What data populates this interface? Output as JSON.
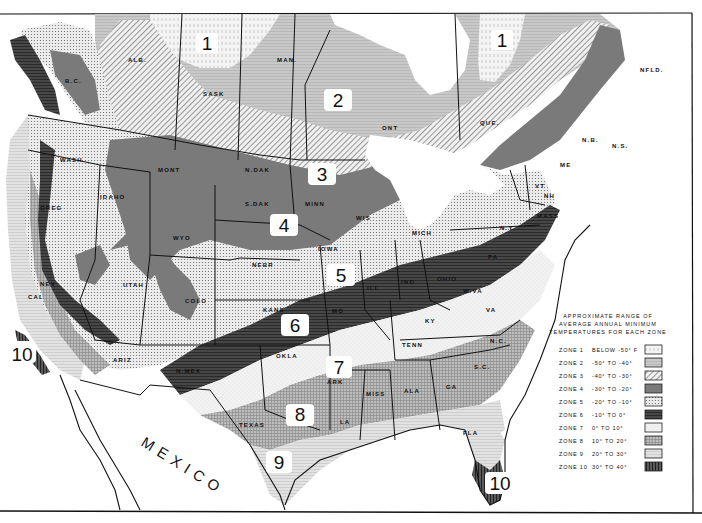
{
  "map": {
    "title": "Plant Hardiness Zone Map of North America",
    "legend": {
      "title_lines": [
        "APPROXIMATE RANGE OF",
        "AVERAGE ANNUAL MINIMUM",
        "TEMPERATURES FOR EACH ZONE"
      ],
      "zones": [
        {
          "zone": "ZONE 1",
          "range": "BELOW -50° F",
          "pattern": "vertical-dash-light"
        },
        {
          "zone": "ZONE 2",
          "range": "-50° TO -40°",
          "pattern": "horizontal-lines-light"
        },
        {
          "zone": "ZONE 3",
          "range": "-40° TO -30°",
          "pattern": "diagonal-hatch"
        },
        {
          "zone": "ZONE 4",
          "range": "-30° TO -20°",
          "pattern": "solid-gray"
        },
        {
          "zone": "ZONE 5",
          "range": "-20° TO -10°",
          "pattern": "dots"
        },
        {
          "zone": "ZONE 6",
          "range": "-10° TO 0°",
          "pattern": "horizontal-lines-dark"
        },
        {
          "zone": "ZONE 7",
          "range": "0° TO 10°",
          "pattern": "light-stipple"
        },
        {
          "zone": "ZONE 8",
          "range": "10° TO 20°",
          "pattern": "crosshatch"
        },
        {
          "zone": "ZONE 9",
          "range": "20° TO 30°",
          "pattern": "horizontal-lines-fine"
        },
        {
          "zone": "ZONE 10",
          "range": "30° TO 40°",
          "pattern": "vertical-lines-dark"
        }
      ]
    },
    "zone_badges": [
      "1",
      "1",
      "2",
      "3",
      "4",
      "5",
      "6",
      "7",
      "8",
      "9",
      "10",
      "10"
    ],
    "region_labels": {
      "alb": "ALB.",
      "sask": "SASK",
      "man": "MAN.",
      "ont": "ONT",
      "que": "QUE.",
      "nfld": "NFLD.",
      "bc": "B.C.",
      "wash": "WASH",
      "oreg": "OREG",
      "idaho": "IDAHO",
      "mont": "MONT",
      "ndak": "N.DAK",
      "sdak": "S.DAK",
      "minn": "MINN",
      "wis": "WIS",
      "mich": "MICH",
      "wyo": "WYO",
      "nev": "NEV",
      "utah": "UTAH",
      "colo": "COLO",
      "nebr": "NEBR",
      "iowa": "IOWA",
      "kans": "KANS",
      "mo": "MO",
      "ill": "ILL",
      "ind": "IND",
      "ohio": "OHIO",
      "ny": "N.Y.",
      "pa": "PA",
      "vt": "VT",
      "nh": "NH",
      "me": "ME",
      "mass": "MASS",
      "nb": "N.B.",
      "ns": "N.S.",
      "ky": "KY",
      "va": "VA",
      "wva": "W.VA",
      "tenn": "TENN",
      "nc": "N.C.",
      "sc": "S.C.",
      "ga": "GA",
      "ala": "ALA",
      "miss": "MISS",
      "ark": "ARK",
      "la": "LA",
      "okla": "OKLA",
      "texas": "TEXAS",
      "nmex": "N.MEX",
      "ariz": "ARIZ",
      "cal": "CAL",
      "fla": "FLA"
    },
    "country_label": "MEXICO"
  }
}
